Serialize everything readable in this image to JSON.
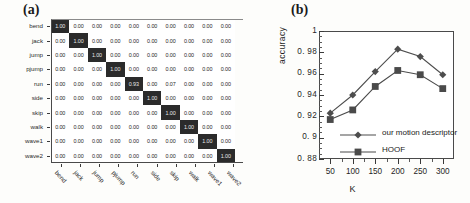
{
  "panels": {
    "a_label": "(a)",
    "b_label": "(b)"
  },
  "confusion_matrix": {
    "type": "heatmap",
    "title": "",
    "classes": [
      "bend",
      "jack",
      "jump",
      "pjump",
      "run",
      "side",
      "skip",
      "walk",
      "wave1",
      "wave2"
    ],
    "row_labels": [
      "bend",
      "jack",
      "jump",
      "pjump",
      "run",
      "side",
      "skip",
      "walk",
      "wave1",
      "wave2"
    ],
    "col_labels": [
      "bend",
      "jack",
      "jump",
      "pjump",
      "run",
      "side",
      "skip",
      "walk",
      "wave1",
      "wave2"
    ],
    "cell_format": "0.00",
    "colors": {
      "high": "#2b2b2b",
      "low": "#ffffff",
      "high_text": "#e8e8e8",
      "low_text": "#262626"
    },
    "note_clipped_last_column": true,
    "rows": [
      {
        "label": "bend",
        "values": [
          1.0,
          0.0,
          0.0,
          0.0,
          0.0,
          0.0,
          0.0,
          0.0,
          0.0,
          0.0
        ]
      },
      {
        "label": "jack",
        "values": [
          0.0,
          1.0,
          0.0,
          0.0,
          0.0,
          0.0,
          0.0,
          0.0,
          0.0,
          0.0
        ]
      },
      {
        "label": "jump",
        "values": [
          0.0,
          0.0,
          1.0,
          0.0,
          0.0,
          0.0,
          0.0,
          0.0,
          0.0,
          0.0
        ]
      },
      {
        "label": "pjump",
        "values": [
          0.0,
          0.0,
          0.0,
          1.0,
          0.0,
          0.0,
          0.0,
          0.0,
          0.0,
          0.0
        ]
      },
      {
        "label": "run",
        "values": [
          0.0,
          0.0,
          0.0,
          0.0,
          0.93,
          0.0,
          0.07,
          0.0,
          0.0,
          0.0
        ]
      },
      {
        "label": "side",
        "values": [
          0.0,
          0.0,
          0.0,
          0.0,
          0.0,
          1.0,
          0.0,
          0.0,
          0.0,
          0.0
        ]
      },
      {
        "label": "skip",
        "values": [
          0.0,
          0.0,
          0.0,
          0.0,
          0.0,
          0.0,
          1.0,
          0.0,
          0.0,
          0.0
        ]
      },
      {
        "label": "walk",
        "values": [
          0.0,
          0.0,
          0.0,
          0.0,
          0.0,
          0.0,
          0.0,
          1.0,
          0.0,
          0.0
        ]
      },
      {
        "label": "wave1",
        "values": [
          0.0,
          0.0,
          0.0,
          0.0,
          0.0,
          0.0,
          0.0,
          0.0,
          1.0,
          0.0
        ]
      },
      {
        "label": "wave2",
        "values": [
          0.0,
          0.0,
          0.0,
          0.0,
          0.0,
          0.0,
          0.0,
          0.0,
          0.0,
          1.0
        ]
      }
    ]
  },
  "chart_data": {
    "type": "line",
    "title": "",
    "xlabel": "K",
    "ylabel": "accuracy",
    "x": [
      50,
      100,
      150,
      200,
      250,
      300
    ],
    "xticklabels": [
      "50",
      "100",
      "150",
      "200",
      "250",
      "300"
    ],
    "yticklabels": [
      "1",
      "0. 98",
      "0. 96",
      "0. 94",
      "0. 92",
      "0. 9",
      "0. 88"
    ],
    "xlim": [
      25,
      325
    ],
    "ylim": [
      0.88,
      1.0
    ],
    "ytick_step": 0.02,
    "grid": false,
    "legend_position": "lower-center-inside",
    "series": [
      {
        "name": "our motion descriptor",
        "marker": "diamond",
        "color": "#4d4d4d",
        "values": [
          0.923,
          0.94,
          0.962,
          0.983,
          0.976,
          0.959
        ]
      },
      {
        "name": "HOOF",
        "marker": "square",
        "color": "#4a4a4a",
        "values": [
          0.917,
          0.926,
          0.948,
          0.963,
          0.959,
          0.946
        ]
      }
    ]
  }
}
